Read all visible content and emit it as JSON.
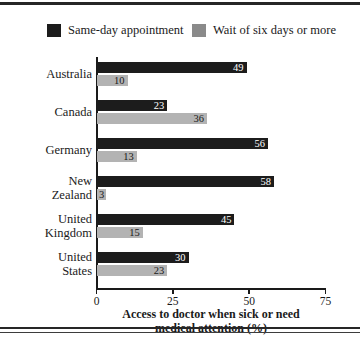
{
  "chart_data": {
    "type": "bar",
    "orientation": "horizontal",
    "title": "",
    "xlabel": "Access to doctor when sick or need medical attention (%)",
    "xlabel_lines": [
      "Access to doctor when sick or need",
      "medical attention (%)"
    ],
    "ylabel": "",
    "xlim": [
      0,
      75
    ],
    "xticks": [
      0,
      25,
      50,
      75
    ],
    "xtick_labels": [
      "0",
      "25",
      "50",
      "75"
    ],
    "grid": false,
    "legend_position": "top",
    "categories": [
      "Australia",
      "Canada",
      "Germany",
      "New Zealand",
      "United Kingdom",
      "United States"
    ],
    "category_label_lines": [
      [
        "Australia"
      ],
      [
        "Canada"
      ],
      [
        "Germany"
      ],
      [
        "New",
        "Zealand"
      ],
      [
        "United",
        "Kingdom"
      ],
      [
        "United",
        "States"
      ]
    ],
    "series": [
      {
        "name": "Same-day appointment",
        "color": "#1c1c1c",
        "values": [
          49,
          23,
          56,
          58,
          45,
          30
        ]
      },
      {
        "name": "Wait of six days or more",
        "color": "#b3b3b3",
        "values": [
          10,
          36,
          13,
          3,
          15,
          23
        ]
      }
    ]
  },
  "legend": {
    "entries": [
      {
        "label": "Same-day appointment",
        "color": "#1c1c1c"
      },
      {
        "label": "Wait of six days or more",
        "color": "#8a8a8a"
      }
    ]
  },
  "colors": {
    "bar_dark": "#1c1c1c",
    "bar_light": "#b3b3b3",
    "axis": "#1a1a1a",
    "background": "#ffffff",
    "rule": "#262626"
  }
}
